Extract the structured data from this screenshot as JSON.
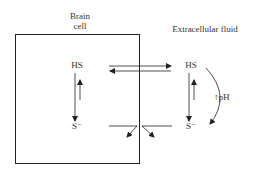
{
  "diagram": {
    "compartments": {
      "cell": {
        "label_line1": "Brain",
        "label_line2": "cell"
      },
      "extracellular": {
        "label": "Extracellular fluid"
      }
    },
    "species": {
      "cell_hs": "HS",
      "cell_s": "S⁻",
      "ecf_hs": "HS",
      "ecf_s": "S⁻"
    },
    "annotations": {
      "ph_label": "↑pH"
    },
    "colors": {
      "ink": "#222222",
      "background": "#ffffff"
    }
  }
}
